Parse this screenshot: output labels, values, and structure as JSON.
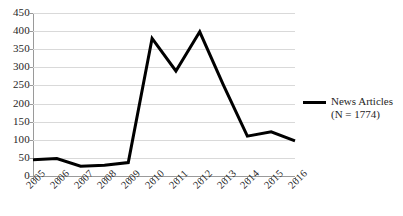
{
  "chart_data": {
    "type": "line",
    "title": "",
    "xlabel": "",
    "ylabel": "",
    "categories": [
      "2005",
      "2006",
      "2007",
      "2008",
      "2009",
      "2010",
      "2011",
      "2012",
      "2013",
      "2014",
      "2015",
      "2016"
    ],
    "series": [
      {
        "name": "News Articles",
        "values": [
          45,
          48,
          27,
          30,
          37,
          380,
          290,
          398,
          250,
          110,
          122,
          97
        ],
        "color": "#000000"
      }
    ],
    "ylim": [
      0,
      450
    ],
    "yticks": [
      0,
      50,
      100,
      150,
      200,
      250,
      300,
      350,
      400,
      450
    ],
    "grid": true,
    "legend_position": "right",
    "legend": {
      "label": "News Articles",
      "sublabel": "(N = 1774)"
    },
    "annotations": []
  },
  "legend": {
    "label": "News Articles",
    "sublabel": "(N = 1774)",
    "swatch_name": "news-articles-line-swatch"
  },
  "colors": {
    "series_line": "#000000",
    "gridline": "#d9d9d9",
    "axis": "#9a9a9a",
    "text": "#262626",
    "background": "#ffffff"
  }
}
